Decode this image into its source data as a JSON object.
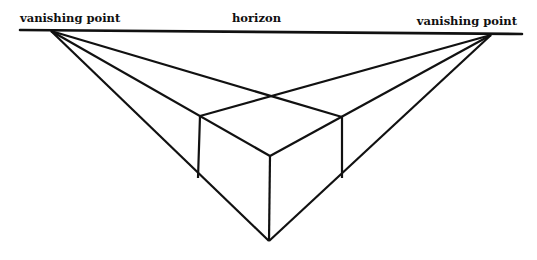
{
  "diagram": {
    "labels": {
      "left_vanishing_point": "vanishing point",
      "horizon": "horizon",
      "right_vanishing_point": "vanishing point"
    },
    "stroke_color": "#111111",
    "background": "#ffffff",
    "points": {
      "horizon_start": [
        20,
        30
      ],
      "horizon_end": [
        522,
        34
      ],
      "left_vp": [
        51,
        31
      ],
      "right_vp": [
        491,
        35
      ],
      "back_top": [
        272,
        96
      ],
      "left_top": [
        200,
        116
      ],
      "right_top": [
        342,
        117
      ],
      "front_top": [
        270,
        156
      ],
      "left_bottom": [
        198,
        178
      ],
      "right_bottom": [
        342,
        178
      ],
      "front_bottom": [
        269,
        241
      ]
    }
  }
}
